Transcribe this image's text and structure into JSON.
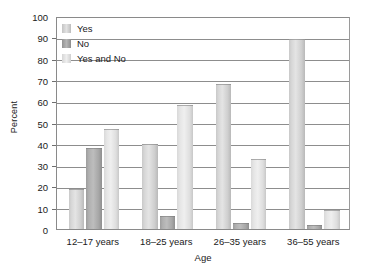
{
  "chart_data": {
    "type": "bar",
    "title": "",
    "xlabel": "Age",
    "ylabel": "Percent",
    "ylim": [
      0,
      100
    ],
    "ytick_step": 10,
    "yticks": [
      0,
      10,
      20,
      30,
      40,
      50,
      60,
      70,
      80,
      90,
      100
    ],
    "grid": true,
    "legend_position": "top-left",
    "categories": [
      "12–17 years",
      "18–25 years",
      "26–35 years",
      "36–55 years"
    ],
    "series": [
      {
        "name": "Yes",
        "values": [
          19,
          40,
          68,
          89
        ]
      },
      {
        "name": "No",
        "values": [
          38,
          6,
          3,
          2
        ]
      },
      {
        "name": "Yes and No",
        "values": [
          47,
          58,
          33,
          9
        ]
      }
    ],
    "colors": {
      "yes": "#d8d8d8",
      "no": "#a8a8a8",
      "yes_and_no": "#e6e6e6",
      "gridline": "#8d8d8d",
      "frame": "#8a8a8a",
      "text": "#1a1a1a",
      "background": "#ffffff"
    }
  }
}
